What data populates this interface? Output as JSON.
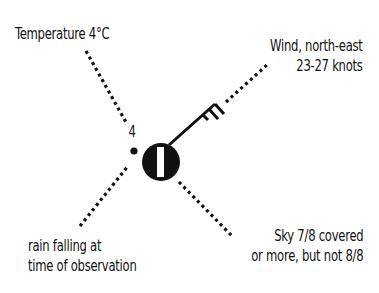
{
  "diagram": {
    "labels": {
      "temperature": "Temperature 4°C",
      "wind_line1": "Wind, north-east",
      "wind_line2": "23-27 knots",
      "rain_line1": "rain falling at",
      "rain_line2": "time of observation",
      "sky_line1": "Sky 7/8 covered",
      "sky_line2": "or more, but not 8/8"
    },
    "station": {
      "temperature_value": "4",
      "cloud_cover": "7/8",
      "wind_direction": "north-east",
      "wind_speed_knots": "23-27",
      "wind_barbs": {
        "full": 2,
        "half": 1
      },
      "present_weather": "rain (dot)"
    },
    "colors": {
      "ink": "#111111",
      "background": "#ffffff"
    }
  }
}
